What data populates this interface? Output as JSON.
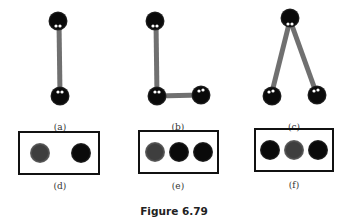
{
  "figure": {
    "caption": "Figure 6.79",
    "colors": {
      "rod": "#707070",
      "dark_ball": "#0a0a0a",
      "grey_ball": "#3e3e3e",
      "box_border": "#111111",
      "highlight": "#ffffff"
    },
    "panels": [
      {
        "id": "a",
        "label": "(a)",
        "description": "vertical rod connecting two dark balls"
      },
      {
        "id": "b",
        "label": "(b)",
        "description": "L-shape: vertical rod plus horizontal rod, three dark balls"
      },
      {
        "id": "c",
        "label": "(c)",
        "description": "inverted V: two rods from a top ball to two bottom balls"
      },
      {
        "id": "d",
        "label": "(d)",
        "description": "box containing grey ball and dark ball, spaced apart"
      },
      {
        "id": "e",
        "label": "(e)",
        "description": "box containing grey ball, dark ball, dark ball"
      },
      {
        "id": "f",
        "label": "(f)",
        "description": "box containing dark ball, grey ball, dark ball"
      }
    ]
  }
}
